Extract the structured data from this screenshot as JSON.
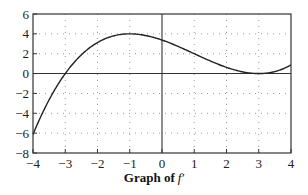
{
  "chart_data": {
    "type": "line",
    "caption_prefix": "Graph of",
    "caption_func": "f′",
    "xlabel": "",
    "ylabel": "",
    "xlim": [
      -4,
      4
    ],
    "ylim": [
      -8,
      6
    ],
    "x_ticks": [
      -4,
      -3,
      -2,
      -1,
      0,
      1,
      2,
      3,
      4
    ],
    "y_ticks": [
      6,
      4,
      2,
      0,
      -2,
      -4,
      -6,
      -8
    ],
    "grid": "dotted",
    "legend": null,
    "series": [
      {
        "name": "f′",
        "description": "f′(x) ≈ 0.125 (x−3)² (x+3)",
        "x": [
          -4,
          -3.5,
          -3,
          -2.5,
          -2,
          -1.5,
          -1,
          -0.5,
          0,
          0.5,
          1,
          1.5,
          2,
          2.5,
          3,
          3.5,
          4
        ],
        "y": [
          -6.13,
          -2.64,
          0,
          1.82,
          3.13,
          3.8,
          4.0,
          3.83,
          3.38,
          2.73,
          2.0,
          1.27,
          0.63,
          0.17,
          0,
          0.2,
          0.88
        ]
      }
    ],
    "annotations": {
      "zero_at": [
        -3,
        3
      ],
      "local_max": {
        "x": -1,
        "y": 4
      },
      "tangent_zero": {
        "x": 3,
        "y": 0
      }
    }
  },
  "labels": {
    "x": [
      "−4",
      "−3",
      "−2",
      "−1",
      "0",
      "1",
      "2",
      "3",
      "4"
    ],
    "y": [
      "6",
      "4",
      "2",
      "0",
      "−2",
      "−4",
      "−6",
      "−8"
    ]
  },
  "colors": {
    "curve": "#222222",
    "axes": "#333333",
    "grid": "#9a9a9a"
  }
}
